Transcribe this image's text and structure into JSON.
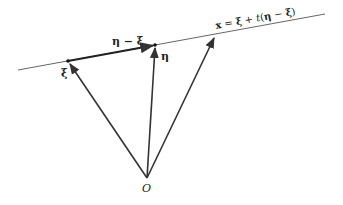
{
  "diagram": {
    "line_label": {
      "x": "x",
      "eq": " = ",
      "xi": "ξ",
      "plus": " + ",
      "t": "t",
      "open": "(",
      "eta": "η",
      "minus": " − ",
      "xi2": "ξ",
      "close": ")"
    },
    "diff_label": "η − ξ",
    "point_xi_label": "ξ",
    "point_eta_label": "η",
    "origin_label": "O",
    "colors": {
      "stroke": "#333333",
      "line": "#555555",
      "text": "#222222"
    },
    "geometry": {
      "line": {
        "x1": 18,
        "y1": 70,
        "x2": 325,
        "y2": 14
      },
      "origin": {
        "x": 147,
        "y": 178
      },
      "xi": {
        "x": 68,
        "y": 61
      },
      "eta": {
        "x": 155,
        "y": 45
      },
      "x_point": {
        "x": 215,
        "y": 36
      }
    }
  }
}
